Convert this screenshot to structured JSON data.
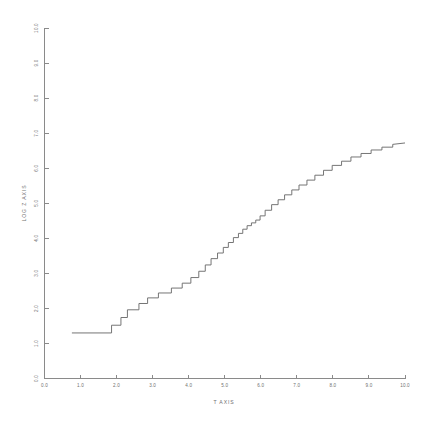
{
  "chart_data": {
    "type": "line",
    "title": "",
    "xlabel": "T AXIS",
    "ylabel": "LOG Z AXIS",
    "xlim": [
      0.0,
      10.0
    ],
    "ylim": [
      0.0,
      10.0
    ],
    "grid": false,
    "legend": null,
    "xticks": [
      "0.0",
      "1.0",
      "2.0",
      "3.0",
      "4.0",
      "5.0",
      "6.0",
      "7.0",
      "8.0",
      "9.0",
      "10.0"
    ],
    "yticks": [
      "0.0",
      "1.0",
      "2.0",
      "3.0",
      "4.0",
      "5.0",
      "6.0",
      "7.0",
      "8.0",
      "9.0",
      "10.0"
    ],
    "xtick_values": [
      0.0,
      1.0,
      2.0,
      3.0,
      4.0,
      5.0,
      6.0,
      7.0,
      8.0,
      9.0,
      10.0
    ],
    "ytick_values": [
      0.0,
      1.0,
      2.0,
      3.0,
      4.0,
      5.0,
      6.0,
      7.0,
      8.0,
      9.0,
      10.0
    ],
    "series": [
      {
        "name": "log z",
        "style": "staircase",
        "x": [
          0.76,
          1.86,
          1.86,
          2.12,
          2.12,
          2.3,
          2.3,
          2.62,
          2.62,
          2.86,
          2.86,
          3.16,
          3.16,
          3.52,
          3.52,
          3.82,
          3.82,
          4.06,
          4.06,
          4.28,
          4.28,
          4.46,
          4.46,
          4.62,
          4.62,
          4.8,
          4.8,
          4.96,
          4.96,
          5.1,
          5.1,
          5.24,
          5.24,
          5.38,
          5.38,
          5.5,
          5.5,
          5.62,
          5.62,
          5.74,
          5.74,
          5.86,
          5.86,
          5.98,
          5.98,
          6.12,
          6.12,
          6.3,
          6.3,
          6.48,
          6.48,
          6.66,
          6.66,
          6.86,
          6.86,
          7.06,
          7.06,
          7.28,
          7.28,
          7.5,
          7.5,
          7.74,
          7.74,
          7.98,
          7.98,
          8.24,
          8.24,
          8.5,
          8.5,
          8.78,
          8.78,
          9.06,
          9.06,
          9.36,
          9.36,
          9.66,
          9.66,
          10.0
        ],
        "y": [
          1.3,
          1.3,
          1.52,
          1.52,
          1.74,
          1.74,
          1.96,
          1.96,
          2.14,
          2.14,
          2.3,
          2.3,
          2.44,
          2.44,
          2.58,
          2.58,
          2.72,
          2.72,
          2.88,
          2.88,
          3.06,
          3.06,
          3.24,
          3.24,
          3.42,
          3.42,
          3.58,
          3.58,
          3.74,
          3.74,
          3.88,
          3.88,
          4.02,
          4.02,
          4.14,
          4.14,
          4.26,
          4.26,
          4.36,
          4.36,
          4.44,
          4.44,
          4.52,
          4.52,
          4.64,
          4.64,
          4.8,
          4.8,
          4.96,
          4.96,
          5.1,
          5.1,
          5.24,
          5.24,
          5.38,
          5.38,
          5.52,
          5.52,
          5.66,
          5.66,
          5.8,
          5.8,
          5.94,
          5.94,
          6.08,
          6.08,
          6.2,
          6.2,
          6.32,
          6.32,
          6.42,
          6.42,
          6.52,
          6.52,
          6.6,
          6.6,
          6.68,
          6.72
        ]
      }
    ],
    "colors": {
      "axis": "#8a8a8a",
      "data": "#6e6e6e",
      "text": "#6f6f6f",
      "background": "#ffffff"
    }
  }
}
